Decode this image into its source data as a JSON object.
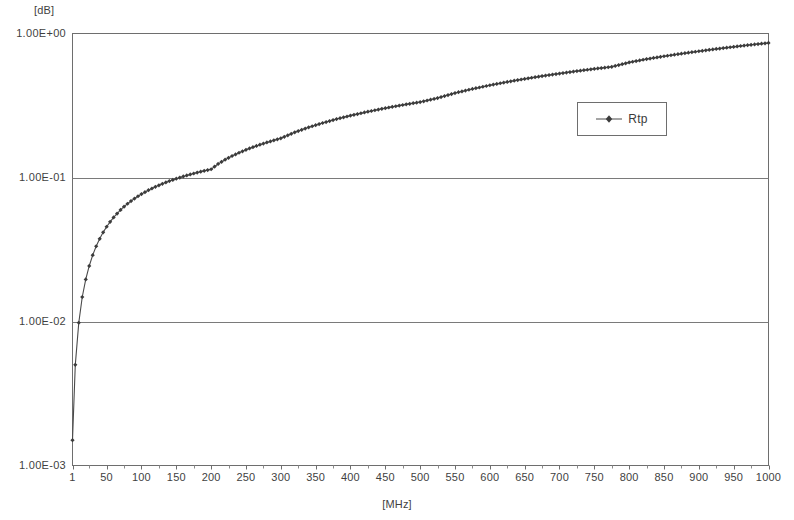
{
  "chart_data": {
    "type": "line",
    "title": "",
    "subtitle": "",
    "xlabel": "[MHz]",
    "ylabel": "[dB]",
    "yscale": "log",
    "xscale": "linear",
    "xlim": [
      1,
      1000
    ],
    "ylim": [
      0.001,
      1.0
    ],
    "grid": "horizontal-only",
    "legend_position": "upper-right-inside",
    "x_tick_labels": [
      "1",
      "50",
      "100",
      "150",
      "200",
      "250",
      "300",
      "350",
      "400",
      "450",
      "500",
      "550",
      "600",
      "650",
      "700",
      "750",
      "800",
      "850",
      "900",
      "950",
      "1000"
    ],
    "x_tick_values": [
      1,
      50,
      100,
      150,
      200,
      250,
      300,
      350,
      400,
      450,
      500,
      550,
      600,
      650,
      700,
      750,
      800,
      850,
      900,
      950,
      1000
    ],
    "y_tick_labels": [
      "1.00E+00",
      "1.00E-01",
      "1.00E-02",
      "1.00E-03"
    ],
    "y_tick_values": [
      1.0,
      0.1,
      0.01,
      0.001
    ],
    "gridline_values": [
      0.1,
      0.01
    ],
    "series": [
      {
        "name": "Rtp",
        "color": "#4a4a4a",
        "marker": "diamond",
        "x": [
          1,
          5,
          10,
          15,
          20,
          25,
          30,
          35,
          40,
          45,
          50,
          55,
          60,
          65,
          70,
          75,
          80,
          85,
          90,
          95,
          100,
          110,
          120,
          130,
          140,
          150,
          160,
          170,
          180,
          190,
          200,
          210,
          220,
          230,
          240,
          250,
          260,
          270,
          280,
          290,
          300,
          320,
          340,
          360,
          380,
          400,
          420,
          440,
          460,
          480,
          500,
          525,
          550,
          575,
          600,
          625,
          650,
          675,
          700,
          725,
          750,
          775,
          800,
          825,
          850,
          875,
          900,
          925,
          950,
          975,
          1000
        ],
        "y": [
          0.0015,
          0.005,
          0.0098,
          0.0148,
          0.0196,
          0.0243,
          0.0289,
          0.0333,
          0.0375,
          0.0416,
          0.0455,
          0.0492,
          0.0528,
          0.0562,
          0.0595,
          0.0627,
          0.0657,
          0.0686,
          0.0714,
          0.0741,
          0.0767,
          0.0816,
          0.0862,
          0.0904,
          0.0944,
          0.0981,
          0.1017,
          0.105,
          0.1082,
          0.1112,
          0.1141,
          0.1242,
          0.133,
          0.141,
          0.1485,
          0.1557,
          0.1625,
          0.169,
          0.1752,
          0.1812,
          0.187,
          0.206,
          0.223,
          0.239,
          0.2545,
          0.269,
          0.283,
          0.2965,
          0.3095,
          0.322,
          0.334,
          0.356,
          0.386,
          0.412,
          0.437,
          0.461,
          0.484,
          0.506,
          0.527,
          0.548,
          0.568,
          0.587,
          0.63,
          0.664,
          0.695,
          0.724,
          0.753,
          0.781,
          0.808,
          0.835,
          0.86
        ]
      }
    ]
  },
  "legend": {
    "entries": [
      {
        "label": "Rtp"
      }
    ]
  },
  "axes": {
    "y_unit": "[dB]",
    "x_title": "[MHz]"
  }
}
